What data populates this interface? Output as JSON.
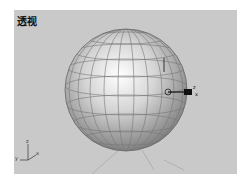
{
  "viewport": {
    "label": "透视",
    "background": "#c9c9c9"
  },
  "object": {
    "type": "sphere",
    "color": "#d0d0d0"
  },
  "gizmo": {
    "axes": [
      "x",
      "y",
      "z"
    ]
  },
  "axis_tripod": {
    "labels": [
      "z",
      "y",
      "x"
    ]
  }
}
